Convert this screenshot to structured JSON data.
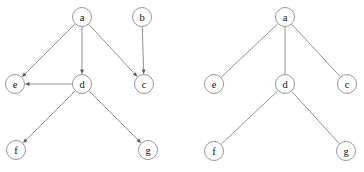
{
  "figure": {
    "title": "",
    "background_color": "#ffffff",
    "node_stroke_color": "#8a8a8a",
    "node_fill_color": "#ffffff",
    "edge_color": "#7d7d7d",
    "label_color": "#111111",
    "node_radius": 9.5
  },
  "graphs": [
    {
      "id": "left-graph",
      "name": "directed-graph",
      "directed": true,
      "nodes": [
        {
          "id": "a",
          "label": "a",
          "x": 82,
          "y": 17
        },
        {
          "id": "b",
          "label": "b",
          "x": 142,
          "y": 17
        },
        {
          "id": "e",
          "label": "e",
          "x": 15,
          "y": 84
        },
        {
          "id": "d",
          "label": "d",
          "x": 82,
          "y": 84
        },
        {
          "id": "c",
          "label": "c",
          "x": 144,
          "y": 84
        },
        {
          "id": "f",
          "label": "f",
          "x": 16,
          "y": 150
        },
        {
          "id": "g",
          "label": "g",
          "x": 148,
          "y": 150
        }
      ],
      "edges": [
        {
          "from": "a",
          "to": "e"
        },
        {
          "from": "a",
          "to": "d"
        },
        {
          "from": "a",
          "to": "c"
        },
        {
          "from": "b",
          "to": "c"
        },
        {
          "from": "d",
          "to": "e"
        },
        {
          "from": "d",
          "to": "f"
        },
        {
          "from": "d",
          "to": "g"
        }
      ]
    },
    {
      "id": "right-graph",
      "name": "undirected-tree",
      "directed": false,
      "nodes": [
        {
          "id": "a",
          "label": "a",
          "x": 285,
          "y": 17
        },
        {
          "id": "e",
          "label": "e",
          "x": 214,
          "y": 84
        },
        {
          "id": "d",
          "label": "d",
          "x": 285,
          "y": 84
        },
        {
          "id": "c",
          "label": "c",
          "x": 347,
          "y": 84
        },
        {
          "id": "f",
          "label": "f",
          "x": 214,
          "y": 151
        },
        {
          "id": "g",
          "label": "g",
          "x": 346,
          "y": 151
        }
      ],
      "edges": [
        {
          "from": "a",
          "to": "e"
        },
        {
          "from": "a",
          "to": "d"
        },
        {
          "from": "a",
          "to": "c"
        },
        {
          "from": "d",
          "to": "f"
        },
        {
          "from": "d",
          "to": "g"
        }
      ]
    }
  ]
}
